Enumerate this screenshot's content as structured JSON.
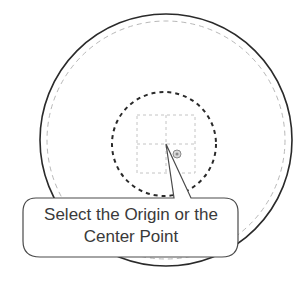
{
  "diagram": {
    "callout": {
      "line1": "Select the Origin or the",
      "line2": "Center Point"
    },
    "elements": {
      "outer_circle": "outer-boundary-circle",
      "outer_dashed_circle": "offset-dashed-circle",
      "inner_dashed_circle": "inner-dashed-circle",
      "grid_square": "dashed-grid-square",
      "origin_marker": "origin-point-marker"
    },
    "colors": {
      "outline": "#2a2a2a",
      "dashed_light": "#b8b8b8",
      "text": "#3a3a3a"
    }
  }
}
